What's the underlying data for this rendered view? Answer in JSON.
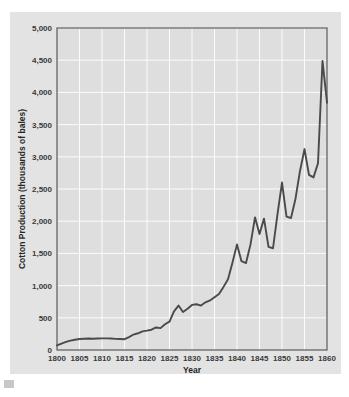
{
  "chart_data": {
    "type": "line",
    "title": "",
    "xlabel": "Year",
    "ylabel": "Cotton Production (thousands of bales)",
    "xlim": [
      1800,
      1860
    ],
    "ylim": [
      0,
      5000
    ],
    "grid": true,
    "legend": false,
    "xticks": [
      1800,
      1805,
      1810,
      1815,
      1820,
      1825,
      1830,
      1835,
      1840,
      1845,
      1850,
      1855,
      1860
    ],
    "xtick_labels": [
      "1800",
      "1805",
      "1810",
      "1815",
      "1820",
      "1825",
      "1830",
      "1835",
      "1840",
      "1845",
      "1850",
      "1855",
      "1860"
    ],
    "yticks": [
      0,
      500,
      1000,
      1500,
      2000,
      2500,
      3000,
      3500,
      4000,
      4500,
      5000
    ],
    "ytick_labels": [
      "0",
      "500",
      "1,000",
      "1,500",
      "2,000",
      "2,500",
      "3,000",
      "3,500",
      "4,000",
      "4,500",
      "5,000"
    ],
    "series": [
      {
        "name": "Cotton Production",
        "color": "#4a4a4a",
        "x": [
          1800,
          1801,
          1802,
          1803,
          1804,
          1805,
          1806,
          1807,
          1808,
          1809,
          1810,
          1811,
          1812,
          1813,
          1814,
          1815,
          1816,
          1817,
          1818,
          1819,
          1820,
          1821,
          1822,
          1823,
          1824,
          1825,
          1826,
          1827,
          1828,
          1829,
          1830,
          1831,
          1832,
          1833,
          1834,
          1835,
          1836,
          1837,
          1838,
          1839,
          1840,
          1841,
          1842,
          1843,
          1844,
          1845,
          1846,
          1847,
          1848,
          1849,
          1850,
          1851,
          1852,
          1853,
          1854,
          1855,
          1856,
          1857,
          1858,
          1859,
          1860
        ],
        "values": [
          73,
          100,
          125,
          145,
          160,
          170,
          175,
          178,
          175,
          178,
          180,
          180,
          178,
          172,
          170,
          168,
          200,
          240,
          260,
          290,
          300,
          315,
          350,
          340,
          400,
          440,
          600,
          690,
          590,
          640,
          700,
          710,
          690,
          740,
          770,
          820,
          870,
          980,
          1100,
          1360,
          1640,
          1380,
          1350,
          1640,
          2060,
          1800,
          2040,
          1600,
          1580,
          2110,
          2600,
          2070,
          2050,
          2350,
          2780,
          3120,
          2720,
          2680,
          2900,
          4490,
          3840
        ]
      }
    ]
  },
  "axis_labels": {
    "y_title": "Cotton Production (thousands of bales)",
    "x_title": "Year"
  },
  "colors": {
    "page_background": "#ffffff",
    "figure_background": "#e3e3e3",
    "plot_background": "#dedede",
    "gridline": "#fbfbfb",
    "line": "#4a4a4a",
    "axis_border": "#5a5a5a",
    "tick_text": "#3a3a3a"
  }
}
